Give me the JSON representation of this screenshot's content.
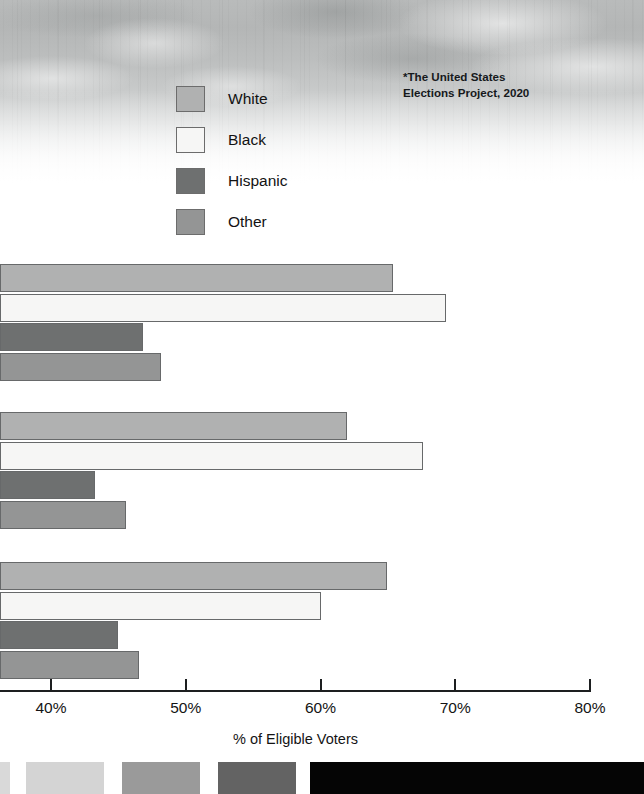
{
  "source_note": "*The United States\nElections Project, 2020",
  "legend": {
    "items": [
      {
        "label": "White",
        "color": "#b0b1b1"
      },
      {
        "label": "Black",
        "color": "#f6f6f5"
      },
      {
        "label": "Hispanic",
        "color": "#6e7070"
      },
      {
        "label": "Other",
        "color": "#949595"
      }
    ]
  },
  "axis": {
    "title": "% of Eligible Voters",
    "ticks": [
      {
        "label": "40%",
        "value": 40
      },
      {
        "label": "50%",
        "value": 50
      },
      {
        "label": "60%",
        "value": 60
      },
      {
        "label": "70%",
        "value": 70
      },
      {
        "label": "80%",
        "value": 80
      }
    ]
  },
  "swatch_strip": {
    "chips": [
      {
        "name": "chip-partial-left",
        "color": "#d9d9d9",
        "x": 0,
        "width": 10
      },
      {
        "name": "chip-light-gray",
        "color": "#d4d4d4",
        "x": 26,
        "width": 78
      },
      {
        "name": "chip-mid-gray",
        "color": "#9a9a9a",
        "x": 122,
        "width": 78
      },
      {
        "name": "chip-dark-gray",
        "color": "#636363",
        "x": 218,
        "width": 78
      },
      {
        "name": "chip-black",
        "color": "#050505",
        "x": 310,
        "width": 334
      }
    ]
  },
  "chart_data": {
    "type": "bar",
    "orientation": "horizontal",
    "title": "",
    "xlabel": "% of Eligible Voters",
    "ylabel": "",
    "xlim": [
      36.2,
      80
    ],
    "xticks": [
      40,
      50,
      60,
      70,
      80
    ],
    "grid": false,
    "legend_position": "top-center",
    "note": "*The United States Elections Project, 2020",
    "categories": [
      "Group 1",
      "Group 2",
      "Group 3"
    ],
    "series": [
      {
        "name": "White",
        "color": "#b0b1b1",
        "values": [
          65.4,
          62.0,
          64.9
        ]
      },
      {
        "name": "Black",
        "color": "#f6f6f5",
        "values": [
          69.3,
          67.6,
          60.0
        ]
      },
      {
        "name": "Hispanic",
        "color": "#6e7070",
        "values": [
          46.8,
          43.3,
          45.0
        ]
      },
      {
        "name": "Other",
        "color": "#949595",
        "values": [
          48.2,
          45.6,
          46.5
        ]
      }
    ]
  }
}
